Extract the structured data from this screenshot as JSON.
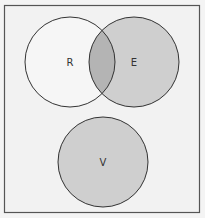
{
  "diagram": {
    "type": "venn",
    "frame": {
      "x": 4,
      "y": 5,
      "width": 196,
      "height": 208,
      "stroke": "#555555",
      "fill": "#f2f2f2"
    },
    "circles": [
      {
        "id": "R",
        "label": "R",
        "cx": 70,
        "cy": 62,
        "r": 45,
        "fill": "#f4f4f4",
        "shaded": false
      },
      {
        "id": "E",
        "label": "E",
        "cx": 134,
        "cy": 62,
        "r": 45,
        "fill": "#cfcfcf",
        "shaded": true
      },
      {
        "id": "V",
        "label": "V",
        "cx": 103,
        "cy": 162,
        "r": 45,
        "fill": "#cfcfcf",
        "shaded": true
      }
    ],
    "intersection": {
      "sets": [
        "R",
        "E"
      ],
      "fill": "#b4b4b4",
      "shaded": true
    },
    "stroke_color": "#333333"
  }
}
